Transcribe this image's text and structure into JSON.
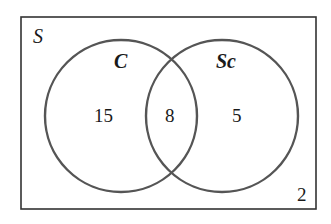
{
  "diagram": {
    "type": "venn",
    "universe_label": "S",
    "sets": [
      {
        "name": "C",
        "only_count": "15"
      },
      {
        "name": "Sc",
        "only_count": "5"
      }
    ],
    "intersection_count": "8",
    "outside_count": "2",
    "colors": {
      "rectangle": "#333333",
      "circle": "#555555",
      "text": "#1a1a1a",
      "background": "#ffffff"
    }
  }
}
